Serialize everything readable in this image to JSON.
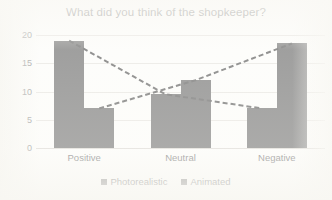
{
  "chart_data": {
    "type": "bar",
    "title": "What did you think of the shopkeeper?",
    "xlabel": "",
    "ylabel": "",
    "categories": [
      "Positive",
      "Neutral",
      "Negative"
    ],
    "series": [
      {
        "name": "Photorealistic",
        "values": [
          19,
          9.5,
          7
        ],
        "color": "#808080"
      },
      {
        "name": "Animated",
        "values": [
          7,
          12,
          18.5
        ],
        "color": "#808080"
      }
    ],
    "ylim": [
      0,
      20
    ],
    "yticks": [
      0,
      5,
      10,
      15,
      20
    ],
    "ytick_labels": [
      "0",
      "5",
      "10",
      "15",
      "20"
    ],
    "grid": true,
    "legend_position": "bottom",
    "trendlines": [
      {
        "name": "Photorealistic",
        "points": [
          19,
          9.5,
          7
        ],
        "style": "dashed",
        "color": "#6e6e6e"
      },
      {
        "name": "Animated",
        "points": [
          7,
          12,
          18.5
        ],
        "style": "dashed",
        "color": "#6e6e6e"
      }
    ]
  },
  "legend": {
    "entries": [
      {
        "label": "Photorealistic"
      },
      {
        "label": "Animated"
      }
    ]
  }
}
